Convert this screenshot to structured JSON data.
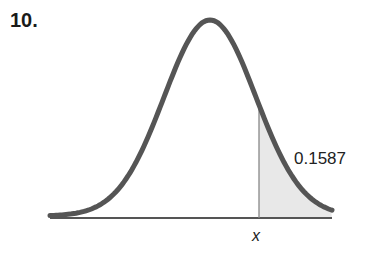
{
  "problem": {
    "number": "10."
  },
  "diagram": {
    "type": "normal-distribution-curve",
    "shaded_region": "right tail beyond x",
    "area_label": "0.1587",
    "x_label": "x",
    "colors": {
      "curve": "#555555",
      "shade": "#e8e8e8",
      "axis": "#555555",
      "marker": "#888888"
    }
  },
  "chart_data": {
    "type": "area",
    "annotations": [
      {
        "text": "0.1587",
        "region": "x to +infinity"
      }
    ],
    "xlabel": "x",
    "shaded_area": 0.1587
  }
}
